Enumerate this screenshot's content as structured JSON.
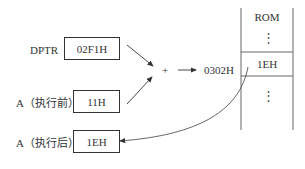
{
  "diagram": {
    "dptr": {
      "label": "DPTR",
      "value": "02F1H"
    },
    "a_before": {
      "label": "A（执行前）",
      "value": "11H"
    },
    "a_after": {
      "label": "A（执行后）",
      "value": "1EH"
    },
    "operator": "+",
    "result_address": "0302H",
    "rom": {
      "title": "ROM",
      "top_ellipsis": "⋮",
      "cell_value": "1EH",
      "bottom_ellipsis": "⋮"
    },
    "colors": {
      "line": "#333333",
      "background": "#ffffff"
    }
  }
}
